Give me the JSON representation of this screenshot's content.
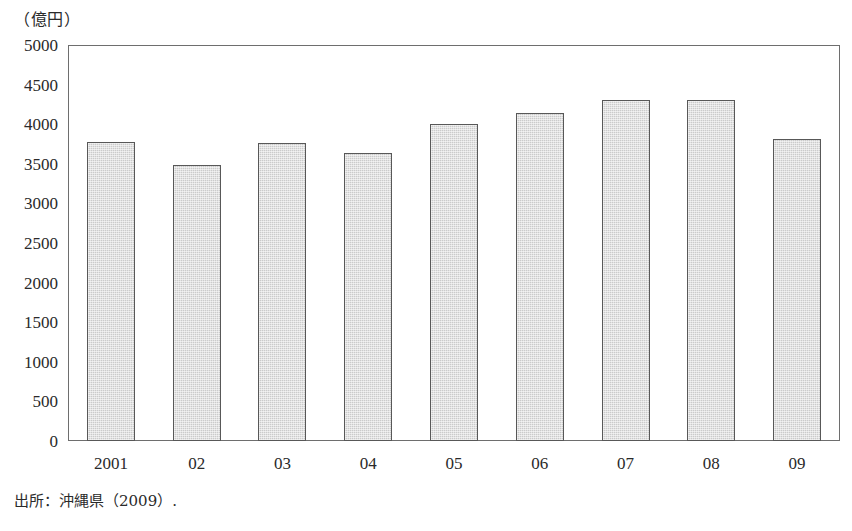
{
  "figure": {
    "unit_caption": "（億円）",
    "source_note": "出所：沖縄県（2009）."
  },
  "chart_data": {
    "type": "bar",
    "title": "",
    "subtitle": "",
    "xlabel": "",
    "ylabel": "（億円）",
    "categories": [
      "2001",
      "02",
      "03",
      "04",
      "05",
      "06",
      "07",
      "08",
      "09"
    ],
    "values": [
      3780,
      3480,
      3760,
      3640,
      4000,
      4140,
      4300,
      4310,
      3810
    ],
    "series": [
      {
        "name": "",
        "values": [
          3780,
          3480,
          3760,
          3640,
          4000,
          4140,
          4300,
          4310,
          3810
        ]
      }
    ],
    "ylim": [
      0,
      5000
    ],
    "ytick_step": 500,
    "ytick_labels": [
      "5000",
      "4500",
      "4000",
      "3500",
      "3000",
      "2500",
      "2000",
      "1500",
      "1000",
      "500",
      "0"
    ],
    "ytick_values": [
      5000,
      4500,
      4000,
      3500,
      3000,
      2500,
      2000,
      1500,
      1000,
      500,
      0
    ],
    "grid": false,
    "legend": false,
    "legend_position": "none",
    "bar_fill_color": "#cbcbcb",
    "bar_border_color": "#585858",
    "axis_color": "#6e6e6e",
    "background_color": "#ffffff",
    "annotations": []
  }
}
